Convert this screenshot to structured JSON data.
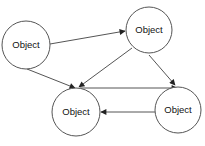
{
  "diagram": {
    "nodes": [
      {
        "id": "left",
        "label": "Object",
        "cx": 26,
        "cy": 45,
        "r": 24
      },
      {
        "id": "top-right",
        "label": "Object",
        "cx": 149,
        "cy": 30,
        "r": 23
      },
      {
        "id": "bottom-middle",
        "label": "Object",
        "cx": 76,
        "cy": 112,
        "r": 24
      },
      {
        "id": "bottom-right",
        "label": "Object",
        "cx": 178,
        "cy": 110,
        "r": 23
      }
    ],
    "edges": [
      {
        "from": "left",
        "to": "top-right"
      },
      {
        "from": "left",
        "to": "bottom-middle"
      },
      {
        "from": "top-right",
        "to": "bottom-middle"
      },
      {
        "from": "top-right",
        "to": "bottom-right"
      },
      {
        "from": "bottom-middle",
        "to": "bottom-right"
      },
      {
        "from": "bottom-right",
        "to": "bottom-middle"
      }
    ],
    "colors": {
      "stroke": "#555555",
      "text": "#111111",
      "background": "#ffffff"
    }
  }
}
